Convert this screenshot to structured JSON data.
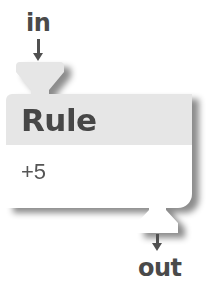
{
  "diagram": {
    "input_port": {
      "label": "in"
    },
    "node": {
      "title": "Rule",
      "body": "+5"
    },
    "output_port": {
      "label": "out"
    }
  },
  "colors": {
    "header_bg": "#e6e6e6",
    "body_bg": "#ffffff",
    "text": "#474747",
    "arrow": "#505050"
  }
}
